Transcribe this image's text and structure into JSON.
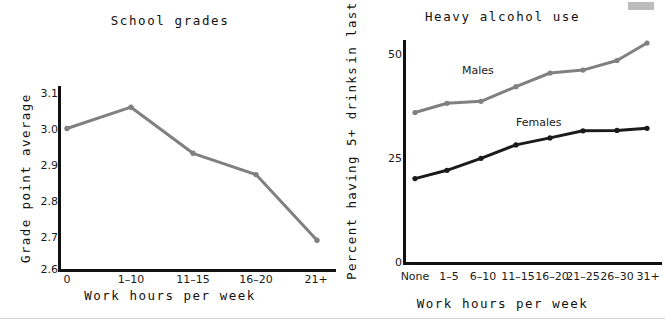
{
  "figure": {
    "width": 665,
    "height": 323,
    "background": "#ffffff",
    "corner_marker_color": "#bcbcbc"
  },
  "colors": {
    "axis": "#111111",
    "gray_series": "#808080",
    "dark_series": "#1a1a1a",
    "text": "#111111"
  },
  "panels": {
    "left": {
      "title": "School grades",
      "xlabel": "Work hours per week",
      "ylabel": "Grade point average",
      "y_ticks": [
        "3.1",
        "3.0",
        "2.9",
        "2.8",
        "2.7",
        "2.6"
      ],
      "x_ticks": [
        "0",
        "1–10",
        "11–15",
        "16–20",
        "21+"
      ]
    },
    "right": {
      "title": "Heavy alcohol use",
      "xlabel": "Work hours per week",
      "ylabel_line1": "Percent having 5+ drinks",
      "ylabel_line2": "in last 2 weeks",
      "y_ticks": [
        "50",
        "25",
        "0"
      ],
      "x_ticks": [
        "None",
        "1–5",
        "6–10",
        "11–15",
        "16–20",
        "21–25",
        "26–30",
        "31+"
      ],
      "series_labels": {
        "males": "Males",
        "females": "Females"
      }
    }
  },
  "chart_data": [
    {
      "type": "line",
      "title": "School grades",
      "xlabel": "Work hours per week",
      "ylabel": "Grade point average",
      "categories": [
        "0",
        "1–10",
        "11–15",
        "16–20",
        "21+"
      ],
      "values": [
        3.0,
        3.06,
        2.93,
        2.87,
        2.685
      ],
      "ylim": [
        2.6,
        3.1
      ],
      "yticks": [
        2.6,
        2.7,
        2.8,
        2.9,
        3.0,
        3.1
      ],
      "grid": false,
      "legend": "none",
      "series_color": "#808080",
      "marker": "circle"
    },
    {
      "type": "line",
      "title": "Heavy alcohol use",
      "xlabel": "Work hours per week",
      "ylabel": "Percent having 5+ drinks in last 2 weeks",
      "categories": [
        "None",
        "1–5",
        "6–10",
        "11–15",
        "16–20",
        "21–25",
        "26–30",
        "31+"
      ],
      "series": [
        {
          "name": "Males",
          "values": [
            36.3,
            38.5,
            39.0,
            42.5,
            45.8,
            46.5,
            48.8,
            53.0
          ],
          "color": "#808080"
        },
        {
          "name": "Females",
          "values": [
            20.4,
            22.4,
            25.3,
            28.5,
            30.2,
            31.9,
            32.0,
            32.5
          ],
          "color": "#1a1a1a"
        }
      ],
      "ylim": [
        0,
        57
      ],
      "yticks": [
        0,
        25,
        50
      ],
      "grid": false,
      "legend": "inline-annotations",
      "annotations": [
        "Males",
        "Females"
      ]
    }
  ]
}
